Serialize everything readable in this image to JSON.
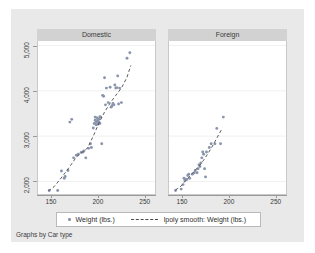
{
  "figure": {
    "caption": "Graphs by Car type",
    "background_color": "#e9e9e9",
    "panel_background_color": "#ffffff",
    "panel_header_color": "#d2d2d2",
    "marker_color": "#8a95ad",
    "smooth_line_color": "#4a4a4a"
  },
  "legend": {
    "points_label": "Weight (lbs.)",
    "smooth_label": "lpoly smooth: Weight (lbs.)"
  },
  "chart_data": {
    "type": "scatter",
    "title": "",
    "subtitle": "",
    "xlabel": "",
    "ylabel": "",
    "caption": "Graphs by Car type",
    "grid": true,
    "grid_axis": "y",
    "legend_position": "bottom",
    "xlim": [
      135,
      262
    ],
    "ylim": [
      1700,
      5100
    ],
    "xticks": [
      150,
      200,
      250
    ],
    "xticklabels": [
      "150",
      "200",
      "250"
    ],
    "yticks": [
      2000,
      3000,
      4000,
      5000
    ],
    "yticklabels": [
      "2,000",
      "3,000",
      "4,000",
      "5,000"
    ],
    "facet_by": "Car type",
    "panels": [
      {
        "name": "Domestic",
        "series": [
          {
            "name": "Weight (lbs.)",
            "type": "scatter",
            "marker": "circle",
            "color": "#8a95ad",
            "points": [
              [
                147,
                1800
              ],
              [
                156,
                1800
              ],
              [
                160,
                2230
              ],
              [
                163,
                2070
              ],
              [
                164,
                2110
              ],
              [
                167,
                2240
              ],
              [
                169,
                3310
              ],
              [
                171,
                3370
              ],
              [
                173,
                2520
              ],
              [
                176,
                2580
              ],
              [
                178,
                2600
              ],
              [
                181,
                2640
              ],
              [
                183,
                2650
              ],
              [
                184,
                2670
              ],
              [
                186,
                2520
              ],
              [
                189,
                2730
              ],
              [
                191,
                2830
              ],
              [
                192,
                2750
              ],
              [
                194,
                3180
              ],
              [
                195,
                3280
              ],
              [
                196,
                3350
              ],
              [
                196,
                3420
              ],
              [
                197,
                3300
              ],
              [
                197,
                3250
              ],
              [
                198,
                3330
              ],
              [
                198,
                3400
              ],
              [
                199,
                3260
              ],
              [
                199,
                3350
              ],
              [
                200,
                3310
              ],
              [
                200,
                3380
              ],
              [
                201,
                3280
              ],
              [
                201,
                3430
              ],
              [
                202,
                3420
              ],
              [
                203,
                2830
              ],
              [
                204,
                3900
              ],
              [
                205,
                3880
              ],
              [
                206,
                4290
              ],
              [
                207,
                3690
              ],
              [
                208,
                4060
              ],
              [
                210,
                3740
              ],
              [
                212,
                4080
              ],
              [
                213,
                3640
              ],
              [
                214,
                3670
              ],
              [
                215,
                3720
              ],
              [
                216,
                3690
              ],
              [
                217,
                4130
              ],
              [
                218,
                4060
              ],
              [
                219,
                4070
              ],
              [
                220,
                4330
              ],
              [
                221,
                3710
              ],
              [
                222,
                4060
              ],
              [
                224,
                3740
              ],
              [
                230,
                4720
              ],
              [
                233,
                4840
              ]
            ]
          },
          {
            "name": "lpoly smooth: Weight (lbs.)",
            "type": "line",
            "style": "dashed",
            "color": "#4a4a4a",
            "points": [
              [
                146,
                1790
              ],
              [
                152,
                1880
              ],
              [
                158,
                2030
              ],
              [
                164,
                2190
              ],
              [
                170,
                2360
              ],
              [
                176,
                2540
              ],
              [
                182,
                2640
              ],
              [
                188,
                2740
              ],
              [
                194,
                3000
              ],
              [
                200,
                3290
              ],
              [
                206,
                3530
              ],
              [
                212,
                3730
              ],
              [
                218,
                3900
              ],
              [
                224,
                4060
              ],
              [
                230,
                4300
              ],
              [
                234,
                4560
              ]
            ]
          }
        ]
      },
      {
        "name": "Foreign",
        "series": [
          {
            "name": "Weight (lbs.)",
            "type": "scatter",
            "marker": "circle",
            "color": "#8a95ad",
            "points": [
              [
                142,
                1800
              ],
              [
                148,
                1830
              ],
              [
                150,
                1930
              ],
              [
                151,
                2070
              ],
              [
                152,
                2020
              ],
              [
                153,
                2050
              ],
              [
                154,
                2040
              ],
              [
                155,
                2130
              ],
              [
                156,
                2160
              ],
              [
                157,
                2070
              ],
              [
                160,
                2160
              ],
              [
                162,
                2190
              ],
              [
                163,
                2240
              ],
              [
                165,
                2190
              ],
              [
                166,
                2280
              ],
              [
                167,
                2370
              ],
              [
                168,
                2330
              ],
              [
                169,
                2410
              ],
              [
                170,
                2520
              ],
              [
                171,
                2650
              ],
              [
                172,
                2600
              ],
              [
                173,
                2280
              ],
              [
                174,
                2100
              ],
              [
                175,
                2650
              ],
              [
                178,
                2750
              ],
              [
                180,
                2830
              ],
              [
                184,
                2830
              ],
              [
                186,
                3170
              ],
              [
                190,
                2830
              ],
              [
                193,
                3420
              ]
            ]
          },
          {
            "name": "lpoly smooth: Weight (lbs.)",
            "type": "line",
            "style": "dashed",
            "color": "#4a4a4a",
            "points": [
              [
                142,
                1810
              ],
              [
                148,
                1900
              ],
              [
                152,
                2000
              ],
              [
                156,
                2090
              ],
              [
                160,
                2180
              ],
              [
                164,
                2270
              ],
              [
                168,
                2360
              ],
              [
                172,
                2470
              ],
              [
                176,
                2600
              ],
              [
                180,
                2730
              ],
              [
                184,
                2880
              ],
              [
                188,
                3030
              ],
              [
                192,
                3180
              ]
            ]
          }
        ]
      }
    ]
  }
}
